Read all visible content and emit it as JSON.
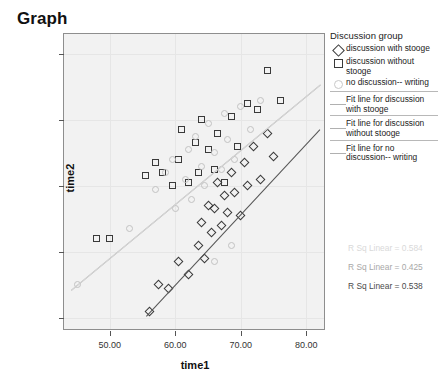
{
  "title": "Graph",
  "chart_data": {
    "type": "scatter",
    "title": "Graph",
    "xlabel": "time1",
    "ylabel": "time2",
    "xlim": [
      43,
      83
    ],
    "ylim": [
      28,
      73
    ],
    "xticks": [
      "50.00",
      "60.00",
      "70.00",
      "80.00"
    ],
    "xtick_values": [
      50,
      60,
      70,
      80
    ],
    "yticks": [
      "30.00",
      "40.00",
      "50.00",
      "60.00",
      "70.00"
    ],
    "ytick_values": [
      30,
      40,
      50,
      60,
      70
    ],
    "grid": true,
    "legend_position": "right",
    "legend_title": "Discussion group",
    "series": [
      {
        "name": "discussion with stooge",
        "marker": "diamond",
        "color": "#3a3a3a",
        "points": [
          [
            56.0,
            31.0
          ],
          [
            57.5,
            35.0
          ],
          [
            59.0,
            34.5
          ],
          [
            60.5,
            38.5
          ],
          [
            62.0,
            36.5
          ],
          [
            63.5,
            41.0
          ],
          [
            64.0,
            44.5
          ],
          [
            64.5,
            39.0
          ],
          [
            65.0,
            47.0
          ],
          [
            65.5,
            43.0
          ],
          [
            66.0,
            46.5
          ],
          [
            66.5,
            50.5
          ],
          [
            67.0,
            44.0
          ],
          [
            67.5,
            48.5
          ],
          [
            68.0,
            46.0
          ],
          [
            68.5,
            52.0
          ],
          [
            69.0,
            49.0
          ],
          [
            70.0,
            45.5
          ],
          [
            70.5,
            53.5
          ],
          [
            71.0,
            50.0
          ],
          [
            72.0,
            56.0
          ],
          [
            73.0,
            51.0
          ],
          [
            74.0,
            58.0
          ],
          [
            75.0,
            54.5
          ]
        ]
      },
      {
        "name": "discussion without stooge",
        "marker": "square",
        "color": "#3a3a3a",
        "points": [
          [
            48.0,
            42.0
          ],
          [
            50.0,
            42.0
          ],
          [
            55.5,
            51.5
          ],
          [
            57.0,
            53.5
          ],
          [
            58.0,
            52.0
          ],
          [
            59.5,
            50.0
          ],
          [
            60.5,
            54.0
          ],
          [
            61.0,
            58.5
          ],
          [
            62.0,
            50.5
          ],
          [
            63.0,
            56.5
          ],
          [
            63.5,
            52.0
          ],
          [
            64.0,
            60.0
          ],
          [
            65.0,
            55.5
          ],
          [
            66.0,
            52.5
          ],
          [
            66.5,
            58.0
          ],
          [
            67.5,
            50.5
          ],
          [
            68.5,
            60.5
          ],
          [
            69.5,
            56.0
          ],
          [
            71.0,
            62.5
          ],
          [
            72.5,
            61.5
          ],
          [
            74.0,
            67.5
          ],
          [
            76.0,
            63.0
          ]
        ]
      },
      {
        "name": "no discussion-- writing",
        "marker": "circle",
        "color": "#c2c2c2",
        "points": [
          [
            45.0,
            35.0
          ],
          [
            53.0,
            43.5
          ],
          [
            57.0,
            49.5
          ],
          [
            58.5,
            52.0
          ],
          [
            59.5,
            54.0
          ],
          [
            60.0,
            46.5
          ],
          [
            61.5,
            51.0
          ],
          [
            62.0,
            55.5
          ],
          [
            62.5,
            48.0
          ],
          [
            63.0,
            57.5
          ],
          [
            64.0,
            53.0
          ],
          [
            64.5,
            50.0
          ],
          [
            65.0,
            59.5
          ],
          [
            66.0,
            55.0
          ],
          [
            67.0,
            52.5
          ],
          [
            67.5,
            61.0
          ],
          [
            68.0,
            57.0
          ],
          [
            69.0,
            54.0
          ],
          [
            70.0,
            62.0
          ],
          [
            71.5,
            58.5
          ],
          [
            73.0,
            63.0
          ],
          [
            66.0,
            38.5
          ],
          [
            68.5,
            41.0
          ]
        ]
      }
    ],
    "fit_lines": [
      {
        "name": "Fit line for discussion with stooge",
        "color": "#555555",
        "x": [
          55.5,
          82.0
        ],
        "y": [
          30.2,
          58.5
        ],
        "r_sq_label": "R Sq Linear = 0.538"
      },
      {
        "name": "Fit line for discussion without stooge",
        "color": "#a8a8a8",
        "x": [
          44.0,
          82.0
        ],
        "y": [
          34.2,
          65.3
        ],
        "r_sq_label": "R Sq Linear = 0.425"
      },
      {
        "name": "Fit line for no discussion-- writing",
        "color": "#d8d8d8",
        "x": [
          44.0,
          82.0
        ],
        "y": [
          34.2,
          65.3
        ],
        "r_sq_label": "R Sq Linear = 0.584"
      }
    ],
    "annotations": [
      {
        "text": "R Sq Linear = 0.584",
        "color": "#d9d9d9"
      },
      {
        "text": "R Sq Linear = 0.425",
        "color": "#a8a8a8"
      },
      {
        "text": "R Sq Linear = 0.538",
        "color": "#4a4a4a"
      }
    ]
  },
  "legend": {
    "title": "Discussion group",
    "marker_entries": [
      {
        "marker": "diamond",
        "label": "discussion with stooge"
      },
      {
        "marker": "square",
        "label": "discussion without stooge"
      },
      {
        "marker": "circle",
        "label": "no discussion-- writing"
      }
    ],
    "line_entries": [
      {
        "label": "Fit line for discussion with stooge",
        "color": "#b0b0b0"
      },
      {
        "label": "Fit line for discussion without stooge",
        "color": "#b0b0b0"
      },
      {
        "label": "Fit line for no discussion-- writing",
        "color": "#b0b0b0"
      }
    ]
  }
}
